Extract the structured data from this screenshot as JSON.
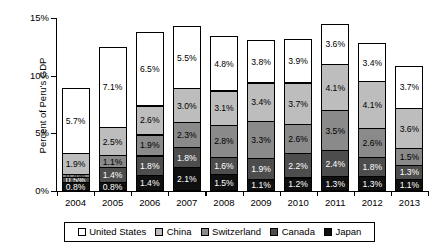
{
  "chart_data": {
    "type": "bar",
    "title": "",
    "subtitle": "",
    "stacked": true,
    "xlabel": "",
    "ylabel": "Percent of Peru's GDP",
    "ylim": [
      0,
      15
    ],
    "ytick_labels": [
      "0%",
      "5%",
      "10%",
      "15%"
    ],
    "ytick_values": [
      0,
      5,
      10,
      15
    ],
    "grid": false,
    "legend_position": "bottom",
    "categories": [
      "2004",
      "2005",
      "2006",
      "2007",
      "2008",
      "2009",
      "2010",
      "2011",
      "2012",
      "2013"
    ],
    "series": [
      {
        "name": "United States",
        "color": "#ffffff",
        "values": [
          5.7,
          7.1,
          6.5,
          5.5,
          4.8,
          3.8,
          3.9,
          3.6,
          3.4,
          3.7
        ],
        "labels": [
          "5.7%",
          "7.1%",
          "6.5%",
          "5.5%",
          "4.8%",
          "3.8%",
          "3.9%",
          "3.6%",
          "3.4%",
          "3.7%"
        ]
      },
      {
        "name": "China",
        "color": "#bdbdbd",
        "values": [
          1.9,
          2.5,
          2.6,
          3.0,
          3.1,
          3.4,
          3.7,
          4.1,
          4.1,
          3.6
        ],
        "labels": [
          "1.9%",
          "2.5%",
          "2.6%",
          "3.0%",
          "3.1%",
          "3.4%",
          "3.7%",
          "4.1%",
          "4.1%",
          "3.6%"
        ]
      },
      {
        "name": "Switzerland",
        "color": "#8a8a8a",
        "values": [
          0.4,
          1.1,
          1.9,
          2.3,
          2.8,
          3.3,
          2.6,
          3.5,
          2.6,
          1.5
        ],
        "labels": [
          "0.4%",
          "1.1%",
          "1.9%",
          "2.3%",
          "2.8%",
          "3.3%",
          "2.6%",
          "3.5%",
          "2.6%",
          "1.5%"
        ]
      },
      {
        "name": "Canada",
        "color": "#4d4d4d",
        "values": [
          0.5,
          1.4,
          1.8,
          1.8,
          1.6,
          1.9,
          2.2,
          2.4,
          1.8,
          1.3
        ],
        "labels": [
          "0.5%",
          "1.4%",
          "1.8%",
          "1.8%",
          "1.6%",
          "1.9%",
          "2.2%",
          "2.4%",
          "1.8%",
          "1.3%"
        ]
      },
      {
        "name": "Japan",
        "color": "#101010",
        "values": [
          0.8,
          0.8,
          1.4,
          2.1,
          1.5,
          1.1,
          1.2,
          1.3,
          1.3,
          1.1
        ],
        "labels": [
          "0.8%",
          "0.8%",
          "1.4%",
          "2.1%",
          "1.5%",
          "1.1%",
          "1.2%",
          "1.3%",
          "1.3%",
          "1.1%"
        ]
      }
    ]
  },
  "legend": {
    "items": [
      {
        "label": "United States",
        "key": "us"
      },
      {
        "label": "China",
        "key": "cn"
      },
      {
        "label": "Switzerland",
        "key": "ch"
      },
      {
        "label": "Canada",
        "key": "ca"
      },
      {
        "label": "Japan",
        "key": "jp"
      }
    ]
  }
}
